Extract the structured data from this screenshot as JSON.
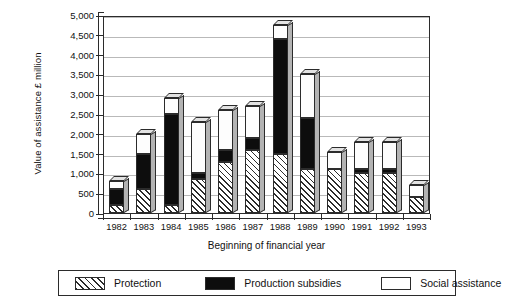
{
  "chart_data": {
    "type": "bar",
    "subtype": "stacked-3d-column",
    "title": "",
    "xlabel": "Beginning of financial year",
    "ylabel": "Value of assistance £ million",
    "ylim": [
      0,
      5000
    ],
    "ytick_values": [
      0,
      500,
      1000,
      1500,
      2000,
      2500,
      3000,
      3500,
      4000,
      4500,
      5000
    ],
    "ytick_labels": [
      "0",
      "500",
      "1,000",
      "1,500",
      "2,000",
      "2,500",
      "3,000",
      "3,500",
      "4,000",
      "4,500",
      "5,000"
    ],
    "grid": true,
    "grid_axis": "y",
    "legend_position": "bottom",
    "categories": [
      "1982",
      "1983",
      "1984",
      "1985",
      "1986",
      "1987",
      "1988",
      "1989",
      "1990",
      "1991",
      "1992",
      "1993"
    ],
    "series": [
      {
        "name": "Protection",
        "fill": "diagonal-hatch",
        "color": "#ffffff",
        "values": [
          200,
          600,
          200,
          850,
          1300,
          1600,
          1500,
          1100,
          1100,
          1000,
          1000,
          400
        ]
      },
      {
        "name": "Production subsidies",
        "fill": "solid",
        "color": "#0d0d0d",
        "values": [
          400,
          900,
          2300,
          150,
          300,
          300,
          2900,
          1300,
          0,
          100,
          100,
          0
        ]
      },
      {
        "name": "Social assistance",
        "fill": "solid",
        "color": "#ffffff",
        "values": [
          200,
          500,
          400,
          1300,
          1000,
          800,
          350,
          1100,
          450,
          700,
          700,
          300
        ]
      }
    ],
    "totals": [
      800,
      2000,
      2900,
      2300,
      2600,
      2700,
      4750,
      3500,
      1550,
      1800,
      1800,
      700
    ]
  },
  "legend": {
    "items": [
      {
        "label": "Protection",
        "swatch": "hatch-swatch"
      },
      {
        "label": "Production subsidies",
        "swatch": "black-swatch"
      },
      {
        "label": "Social assistance",
        "swatch": "white-swatch"
      }
    ]
  }
}
